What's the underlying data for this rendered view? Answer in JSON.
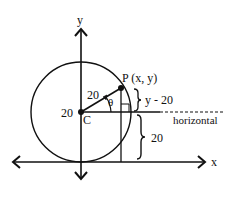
{
  "diagram": {
    "axes": {
      "x_label": "x",
      "y_label": "y"
    },
    "center": {
      "label": "C",
      "y_value_label": "20"
    },
    "point": {
      "label": "P (x, y)"
    },
    "radius_label": "20",
    "angle_label": "θ",
    "vertical_segment_label": "y - 20",
    "lower_segment_label": "20",
    "horizontal_line_label": "horizontal",
    "colors": {
      "stroke": "#111111",
      "background": "#ffffff"
    }
  }
}
